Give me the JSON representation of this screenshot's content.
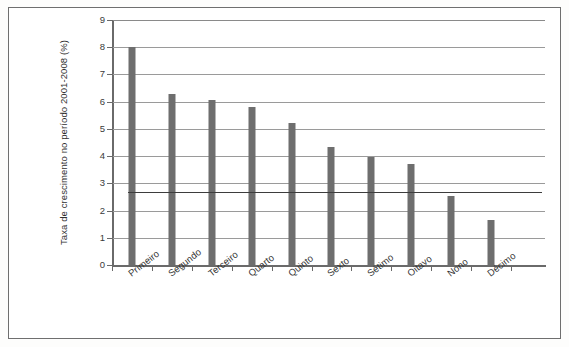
{
  "figure": {
    "clipped_caption": "",
    "frame_color": "#6f6f6f"
  },
  "axis": {
    "y_title": "Taxa de crescimento no período 2001-2008 (%)",
    "y_ticks": [
      "0",
      "1",
      "2",
      "3",
      "4",
      "5",
      "6",
      "7",
      "8",
      "9"
    ]
  },
  "chart_data": {
    "type": "bar",
    "title": "",
    "xlabel": "",
    "ylabel": "Taxa de crescimento no período 2001-2008 (%)",
    "categories": [
      "Primeiro",
      "Segundo",
      "Terceiro",
      "Quarto",
      "Quinto",
      "Sexto",
      "Sétimo",
      "Oitavo",
      "Nono",
      "Décimo"
    ],
    "values": [
      8.0,
      6.3,
      6.05,
      5.8,
      5.2,
      4.35,
      3.95,
      3.72,
      2.55,
      1.65
    ],
    "ylim": [
      0,
      9
    ],
    "ytick_step": 1,
    "grid": true,
    "legend": "none",
    "bar_color": "#6e6e6e",
    "gridline_color": "#9a9a9a",
    "annotations": [
      {
        "kind": "reference-line",
        "orientation": "horizontal",
        "value": 2.7,
        "color": "#3d3d3d"
      }
    ]
  }
}
